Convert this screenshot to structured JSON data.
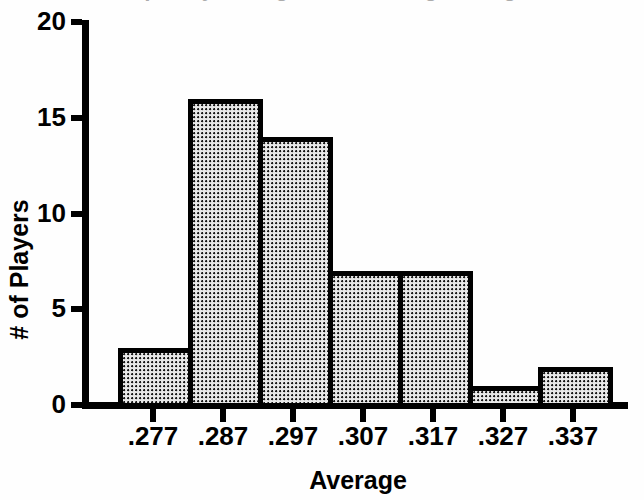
{
  "chart_data": {
    "type": "bar",
    "title": "",
    "xlabel": "Average",
    "ylabel": "# of Players",
    "categories": [
      ".277",
      ".287",
      ".297",
      ".307",
      ".317",
      ".327",
      ".337"
    ],
    "values": [
      3,
      16,
      14,
      7,
      7,
      1,
      2
    ],
    "ylim": [
      0,
      20
    ],
    "yticks": [
      0,
      5,
      10,
      15,
      20
    ],
    "ytick_labels": [
      "0",
      "5",
      "10",
      "15",
      "20"
    ],
    "grid": false,
    "legend": null,
    "bar_fill": "dotted-stipple",
    "bar_edge_color": "#000000",
    "bar_fill_color": "#e8e8e8",
    "background_color": "#ffffff",
    "axis_color": "#000000",
    "note": "Histogram of batting averages; bars are contiguous (histogram bins), tick labels centered under each bin."
  },
  "axes": {
    "x_label": "Average",
    "y_label": "# of Players"
  },
  "title_remnant": "Frequency Histogram of Batting Averages"
}
